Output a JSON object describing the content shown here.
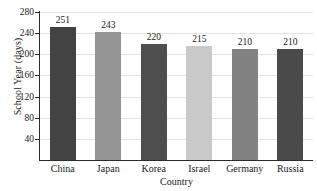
{
  "chart_data": {
    "type": "bar",
    "title": "",
    "xlabel": "Country",
    "ylabel": "School Year (days)",
    "categories": [
      "China",
      "Japan",
      "Korea",
      "Israel",
      "Germany",
      "Russia"
    ],
    "values": [
      251,
      243,
      220,
      215,
      210,
      210
    ],
    "value_labels": [
      "251",
      "243",
      "220",
      "215",
      "210",
      "210"
    ],
    "bar_colors": [
      "#434343",
      "#939393",
      "#4e4e4e",
      "#c9c9c9",
      "#828282",
      "#4a4a4a"
    ],
    "ylim": [
      0,
      280
    ],
    "yticks": [
      280,
      240,
      200,
      160,
      120,
      80,
      40
    ],
    "ytick_labels": [
      "280",
      "240",
      "200",
      "160",
      "120",
      "80",
      "40"
    ],
    "grid": true,
    "grid_color": "#e3e3e3",
    "legend": null,
    "axis_color": "#2b2b2b",
    "background": "#ffffff"
  }
}
